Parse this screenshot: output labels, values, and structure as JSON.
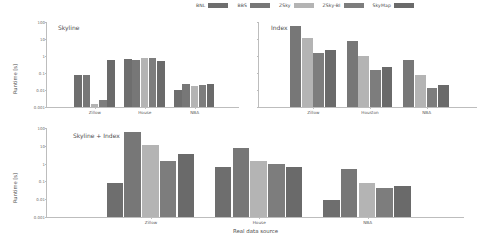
{
  "chart_data": {
    "type": "bar",
    "title": "",
    "xlabel": "Real data source",
    "ylabel": "Runtime [s]",
    "yscale": "log",
    "ylim": [
      0.001,
      100
    ],
    "yticks": [
      "100",
      "10",
      "1",
      "0.1",
      "0.01",
      "0.001"
    ],
    "ytick_values": [
      100,
      10,
      1,
      0.1,
      0.01,
      0.001
    ],
    "grid": false,
    "legend_position": "top-center",
    "legend": [
      {
        "name": "BNL",
        "color": "#6e6e6e"
      },
      {
        "name": "BBS",
        "color": "#777777"
      },
      {
        "name": "ZSky",
        "color": "#b4b4b4"
      },
      {
        "name": "ZSky-BI",
        "color": "#7d7d7d"
      },
      {
        "name": "SkyMap",
        "color": "#6a6a6a"
      }
    ],
    "panels": [
      {
        "label": "Skyline",
        "categories": [
          "Zillow",
          "House",
          "NBA"
        ],
        "series": [
          {
            "name": "BNL",
            "color": "#6e6e6e",
            "values": [
              0.08,
              0.7,
              0.0095
            ]
          },
          {
            "name": "BBS",
            "color": "#777777",
            "values": [
              0.075,
              0.58,
              0.022
            ]
          },
          {
            "name": "ZSky",
            "color": "#b4b4b4",
            "values": [
              0.0016,
              0.72,
              0.018
            ]
          },
          {
            "name": "ZSky-BI",
            "color": "#7d7d7d",
            "values": [
              0.0026,
              0.75,
              0.019
            ]
          },
          {
            "name": "SkyMap",
            "color": "#6a6a6a",
            "values": [
              0.62,
              0.52,
              0.024
            ]
          }
        ]
      },
      {
        "label": "Index",
        "categories": [
          "Zillow",
          "Houston",
          "NBA"
        ],
        "series": [
          {
            "name": "BBS",
            "color": "#777777",
            "values": [
              62.0,
              7.5,
              0.55
            ]
          },
          {
            "name": "ZSky",
            "color": "#b4b4b4",
            "values": [
              11.0,
              0.95,
              0.075
            ]
          },
          {
            "name": "ZSky-BI",
            "color": "#7d7d7d",
            "values": [
              1.6,
              0.145,
              0.0135
            ]
          },
          {
            "name": "SkyMap",
            "color": "#6a6a6a",
            "values": [
              2.3,
              0.22,
              0.021
            ]
          }
        ]
      },
      {
        "label": "Skyline + Index",
        "categories": [
          "Zillow",
          "House",
          "NBA"
        ],
        "series": [
          {
            "name": "BNL",
            "color": "#6e6e6e",
            "values": [
              0.08,
              0.62,
              0.0092
            ]
          },
          {
            "name": "BBS",
            "color": "#777777",
            "values": [
              62.0,
              7.5,
              0.5
            ]
          },
          {
            "name": "ZSky",
            "color": "#b4b4b4",
            "values": [
              11.5,
              1.35,
              0.085
            ]
          },
          {
            "name": "ZSky-BI",
            "color": "#7d7d7d",
            "values": [
              1.35,
              0.92,
              0.043
            ]
          },
          {
            "name": "SkyMap",
            "color": "#6a6a6a",
            "values": [
              3.6,
              0.62,
              0.055
            ]
          }
        ]
      }
    ]
  }
}
